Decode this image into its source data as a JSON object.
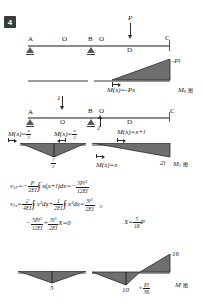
{
  "problem": {
    "number": "4"
  },
  "figures": {
    "beam_top": {
      "points": [
        "A",
        "O",
        "B",
        "O",
        "D",
        "C"
      ],
      "load_label": "P",
      "caption": ""
    },
    "m0_diagram": {
      "peak_label": "-Pl",
      "equation": "M(x)=-Px",
      "name": "M",
      "name_sub": "0",
      "cjk": "图"
    },
    "beam_unit": {
      "points": [
        "A",
        "O",
        "B",
        "O",
        "D",
        "C"
      ],
      "load_down": "1",
      "load_up": "1"
    },
    "m1_diagram": {
      "eq_left": "M(x)=",
      "eq_left_num": "x",
      "eq_left_den": "2",
      "eq_mid": "M(x)=",
      "eq_mid_num": "x",
      "eq_mid_den": "2",
      "eq_right": "M(x)=x+l",
      "eq_bottom": "M(x)=x",
      "peak_num": "l",
      "peak_den": "2",
      "right_label": "2l",
      "name": "M",
      "name_sub": "1",
      "cjk": "图"
    },
    "m_diagram": {
      "label_left": "5",
      "label_mid": "10",
      "label_right": "16",
      "multiplier_prefix": "×",
      "multiplier_num": "Pl",
      "multiplier_den": "36",
      "name": "M",
      "cjk": "图"
    }
  },
  "equations": {
    "line1": {
      "lhs": "v",
      "lhs_sub": "1P",
      "eq": "=−",
      "frac_num": "P",
      "frac_den": "2EI",
      "integral": "∫",
      "lim_low": "0",
      "lim_up": "l",
      "integrand": "x(x+l)dx=−",
      "res_num": "5Pl",
      "res_num_sup": "3",
      "res_den": "12EI"
    },
    "line2": {
      "lhs": "v",
      "lhs_sub": "1x",
      "eq": "=",
      "f1_num": "2",
      "f1_den": "4EI",
      "int1": "∫",
      "int1_low": "0",
      "int1_up": "l",
      "int1_body": "x²dx+",
      "f2_num": "1",
      "f2_den": "2EI",
      "int2": "∫",
      "int2_low": "0",
      "int2_up": "2l",
      "int2_body": "x²dx=",
      "res_num": "3l",
      "res_num_sup": "3",
      "res_den": "2EI"
    },
    "line3": {
      "t1_sign": "−",
      "t1_num": "5Pl",
      "t1_num_sup": "3",
      "t1_den": "12EI",
      "plus": "+",
      "t2_num": "3l",
      "t2_num_sup": "3",
      "t2_den": "2EI",
      "tail": "X=0",
      "result_lhs": "X=",
      "result_num": "5",
      "result_den": "18",
      "result_tail": "P"
    }
  }
}
